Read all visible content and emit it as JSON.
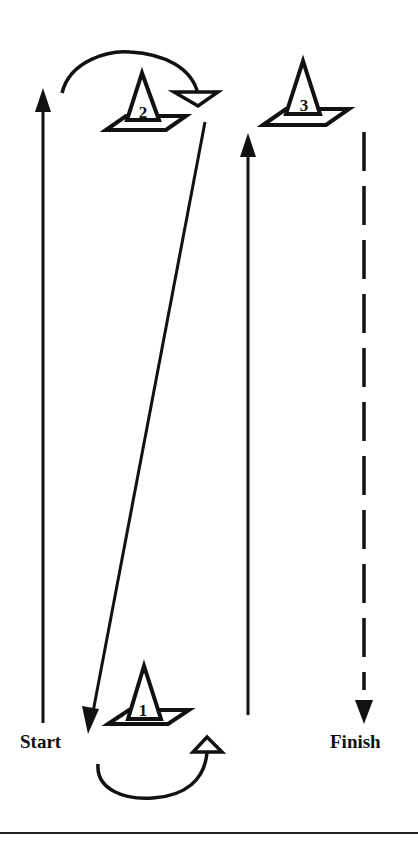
{
  "diagram": {
    "type": "agility drill course",
    "colors": {
      "ink": "#111111",
      "background": "#ffffff"
    },
    "labels": {
      "start": "Start",
      "finish": "Finish"
    },
    "cones": [
      {
        "id": "cone-1",
        "number": "1",
        "position": "bottom-center"
      },
      {
        "id": "cone-2",
        "number": "2",
        "position": "top-left"
      },
      {
        "id": "cone-3",
        "number": "3",
        "position": "top-right"
      }
    ],
    "paths": [
      {
        "id": "path-1",
        "style": "solid",
        "direction": "up",
        "from": "Start",
        "to": "cone 2"
      },
      {
        "id": "path-2",
        "style": "curved",
        "direction": "clockwise around cone 2"
      },
      {
        "id": "path-3",
        "style": "solid",
        "direction": "diagonal down",
        "from": "cone 2",
        "to": "cone 1"
      },
      {
        "id": "path-4",
        "style": "curved",
        "direction": "counter-clockwise around cone 1"
      },
      {
        "id": "path-5",
        "style": "solid",
        "direction": "up",
        "from": "cone 1",
        "to": "cone 3"
      },
      {
        "id": "path-6",
        "style": "dashed",
        "direction": "down",
        "from": "cone 3",
        "to": "Finish"
      }
    ]
  }
}
